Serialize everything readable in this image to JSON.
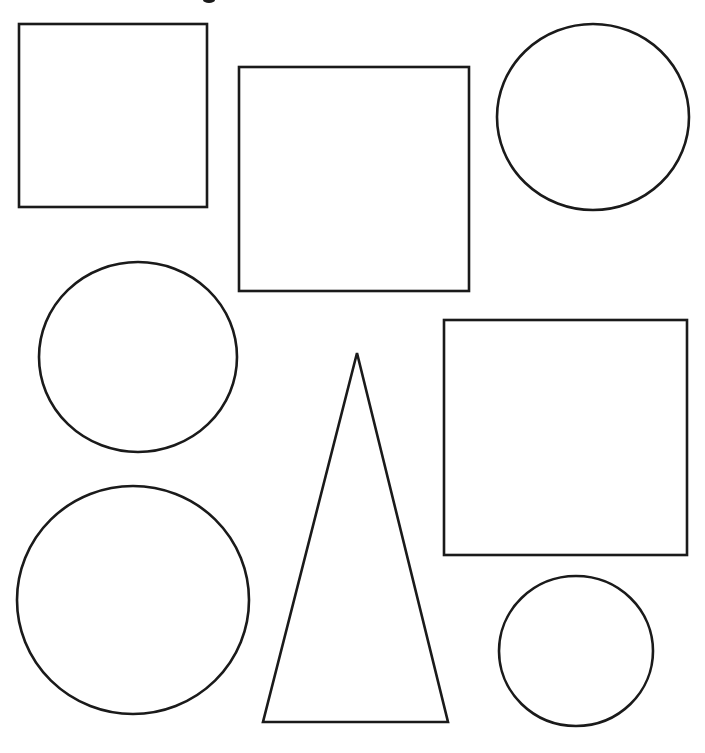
{
  "canvas": {
    "width": 705,
    "height": 753,
    "background": "#ffffff",
    "stroke_color": "#1a1a1a"
  },
  "top_text_fragment": {
    "note": "partially cut-off glyph at top edge",
    "x": 208,
    "y": 0
  },
  "shapes": [
    {
      "id": "square-top-left",
      "type": "rect",
      "x": 19,
      "y": 24,
      "width": 188,
      "height": 183
    },
    {
      "id": "square-top-center",
      "type": "rect",
      "x": 239,
      "y": 67,
      "width": 230,
      "height": 224
    },
    {
      "id": "circle-top-right",
      "type": "ellipse",
      "cx": 593,
      "cy": 117,
      "rx": 96,
      "ry": 93
    },
    {
      "id": "circle-middle-left",
      "type": "ellipse",
      "cx": 138,
      "cy": 357,
      "rx": 99,
      "ry": 95
    },
    {
      "id": "triangle-bottom-center",
      "type": "polygon",
      "points": "357,353 448,722 263,722"
    },
    {
      "id": "square-middle-right",
      "type": "rect",
      "x": 444,
      "y": 320,
      "width": 243,
      "height": 235
    },
    {
      "id": "circle-bottom-left",
      "type": "ellipse",
      "cx": 133,
      "cy": 600,
      "rx": 116,
      "ry": 114
    },
    {
      "id": "circle-bottom-right",
      "type": "ellipse",
      "cx": 576,
      "cy": 651,
      "rx": 77,
      "ry": 75
    }
  ],
  "counts": {
    "squares": 3,
    "circles": 4,
    "triangles": 1,
    "total": 8
  }
}
